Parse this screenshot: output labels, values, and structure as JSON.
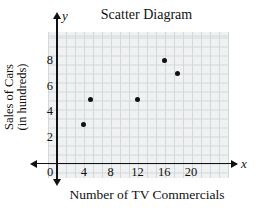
{
  "chart_data": {
    "type": "scatter",
    "title": "Scatter Diagram",
    "xlabel": "Number of TV Commercials",
    "ylabel": "Sales of Cars (in hundreds)",
    "ylabel_lines": [
      "Sales of Cars",
      "(in hundreds)"
    ],
    "axis_letters": {
      "x": "x",
      "y": "y"
    },
    "x_ticks": [
      0,
      4,
      8,
      12,
      16,
      20
    ],
    "y_ticks": [
      2,
      4,
      6,
      8
    ],
    "points": [
      [
        4,
        3
      ],
      [
        5,
        5
      ],
      [
        12,
        5
      ],
      [
        16,
        8
      ],
      [
        18,
        7
      ]
    ],
    "xlim": [
      0,
      25
    ],
    "ylim": [
      0,
      10
    ],
    "grid": true,
    "legend": "none",
    "colors": {
      "point": "#111111",
      "axis": "#111111",
      "grid_line": "#d3d8da",
      "grid_bg": "#f0f1f2",
      "text": "#111111"
    }
  }
}
